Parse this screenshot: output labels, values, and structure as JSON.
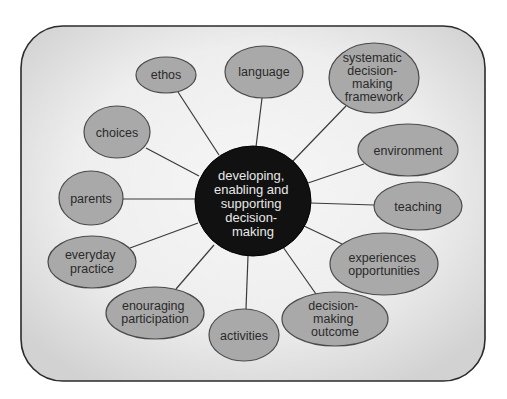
{
  "diagram": {
    "colors": {
      "frame_stroke": "#2b2b2b",
      "frame_fill_center": "#f6f6f6",
      "frame_fill_edge": "#d4d4d4",
      "node_fill": "#a9a9a9",
      "node_stroke": "#4a4a4a",
      "center_fill": "#111111",
      "center_text": "#e8e8e8",
      "connector": "#3a3a3a"
    },
    "center": {
      "lines": [
        "developing,",
        "enabling and",
        "supporting",
        "decision-",
        "making"
      ]
    },
    "nodes": [
      {
        "id": "ethos",
        "lines": [
          "ethos"
        ]
      },
      {
        "id": "language",
        "lines": [
          "language"
        ]
      },
      {
        "id": "systematic-decision-making-framework",
        "lines": [
          "systematic",
          "decision-",
          "making",
          "framework"
        ]
      },
      {
        "id": "choices",
        "lines": [
          "choices"
        ]
      },
      {
        "id": "environment",
        "lines": [
          "environment"
        ]
      },
      {
        "id": "parents",
        "lines": [
          "parents"
        ]
      },
      {
        "id": "teaching",
        "lines": [
          "teaching"
        ]
      },
      {
        "id": "everyday-practice",
        "lines": [
          "everyday",
          "practice"
        ]
      },
      {
        "id": "experiences-opportunities",
        "lines": [
          "experiences",
          "opportunities"
        ]
      },
      {
        "id": "enouraging-participation",
        "lines": [
          "enouraging",
          "participation"
        ]
      },
      {
        "id": "activities",
        "lines": [
          "activities"
        ]
      },
      {
        "id": "decision-making-outcome",
        "lines": [
          "decision-",
          "making",
          "outcome"
        ]
      }
    ],
    "edges": [
      {
        "from": "center",
        "to": "ethos"
      },
      {
        "from": "center",
        "to": "language"
      },
      {
        "from": "center",
        "to": "systematic-decision-making-framework"
      },
      {
        "from": "center",
        "to": "choices"
      },
      {
        "from": "center",
        "to": "environment"
      },
      {
        "from": "center",
        "to": "parents"
      },
      {
        "from": "center",
        "to": "teaching"
      },
      {
        "from": "center",
        "to": "everyday-practice"
      },
      {
        "from": "center",
        "to": "experiences-opportunities"
      },
      {
        "from": "center",
        "to": "enouraging-participation"
      },
      {
        "from": "center",
        "to": "activities"
      },
      {
        "from": "center",
        "to": "decision-making-outcome"
      }
    ]
  }
}
